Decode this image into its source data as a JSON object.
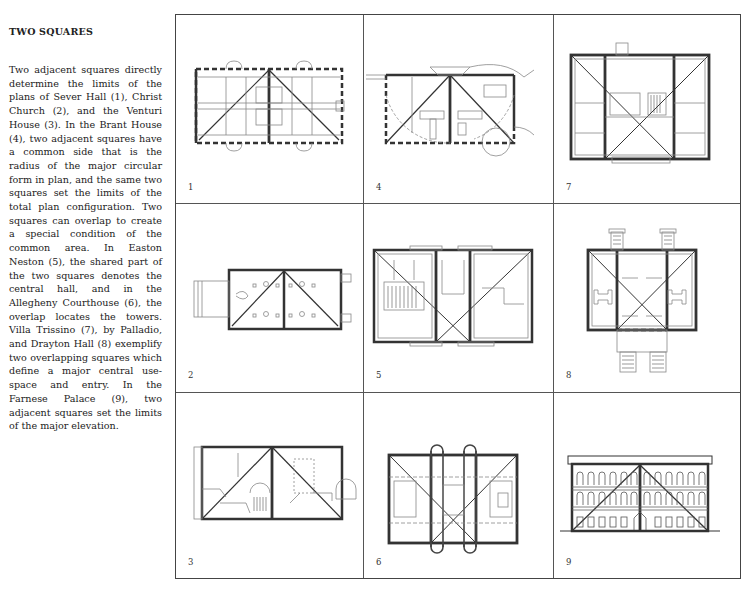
{
  "sidebar": {
    "heading": "TWO SQUARES",
    "paragraph": "Two adjacent squares directly determine the limits of the plans of Sever Hall (1), Christ Church (2), and the Venturi House (3). In the Brant House (4), two adja­cent squares have a common side that is the radius of the major circular form in plan, and the same two squares set the limits of the total plan configuration. Two squares can overlap to cre­ate a special condition of the common area. In Easton Neston (5), the shared part of the two squares denotes the central hall, and in the Allegheny Court­house (6), the overlap locates the towers. Villa Trissino (7), by Pal­ladio, and Drayton Hall (8) ex­emplify two overlapping squares which define a major central use-space and entry. In the Farnese Palace (9), two adjacent squares set the limits of the major ele­vation."
  },
  "figures": [
    {
      "number": "1",
      "building": "Sever Hall",
      "type": "adjacent-plan"
    },
    {
      "number": "4",
      "building": "Brant House",
      "type": "adjacent-plan-circular"
    },
    {
      "number": "7",
      "building": "Villa Trissino",
      "type": "overlap-plan"
    },
    {
      "number": "2",
      "building": "Christ Church",
      "type": "adjacent-plan"
    },
    {
      "number": "5",
      "building": "Easton Neston",
      "type": "overlap-plan"
    },
    {
      "number": "8",
      "building": "Drayton Hall",
      "type": "overlap-plan"
    },
    {
      "number": "3",
      "building": "Venturi House",
      "type": "adjacent-plan"
    },
    {
      "number": "6",
      "building": "Allegheny Courthouse",
      "type": "overlap-plan"
    },
    {
      "number": "9",
      "building": "Farnese Palace",
      "type": "adjacent-elevation"
    }
  ]
}
